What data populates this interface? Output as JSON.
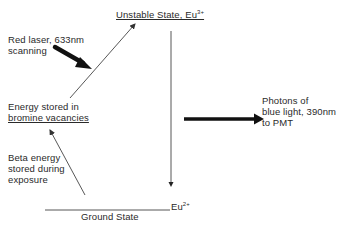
{
  "diagram": {
    "type": "energy-level-diagram",
    "unstable_state": {
      "label": "Unstable State, Eu",
      "superscript": "3+"
    },
    "ground_state": {
      "label": "Ground State",
      "ion_label": "Eu",
      "superscript": "2+"
    },
    "red_laser": {
      "line1": "Red laser, 633nm",
      "line2": "scanning"
    },
    "energy_stored": {
      "line1": "Energy stored in",
      "line2": "bromine vacancies"
    },
    "beta_energy": {
      "line1": "Beta energy",
      "line2": "stored during",
      "line3": "exposure"
    },
    "photons": {
      "line1": "Photons of",
      "line2": "blue light, 390nm",
      "line3": "to PMT"
    },
    "colors": {
      "line": "#3a3a3a",
      "text": "#2a2a2a",
      "background": "#ffffff"
    }
  }
}
